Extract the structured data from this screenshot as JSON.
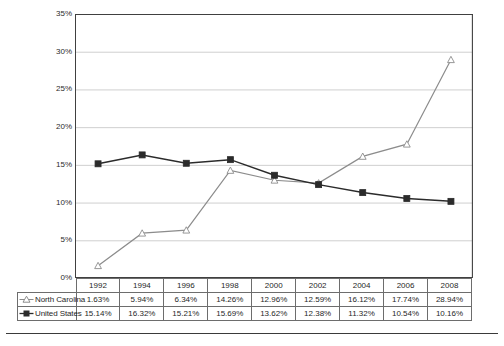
{
  "chart_data": {
    "type": "line",
    "title": "",
    "xlabel": "",
    "ylabel": "",
    "categories": [
      "1992",
      "1994",
      "1996",
      "1998",
      "2000",
      "2002",
      "2004",
      "2006",
      "2008"
    ],
    "ylim": [
      0,
      35
    ],
    "ytick_labels": [
      "0%",
      "5%",
      "10%",
      "15%",
      "20%",
      "25%",
      "30%",
      "35%"
    ],
    "ytick_values": [
      0,
      5,
      10,
      15,
      20,
      25,
      30,
      35
    ],
    "grid": true,
    "legend_position": "data-table",
    "series": [
      {
        "name": "North Carolina",
        "marker": "open-triangle",
        "color": "#8c8c8c",
        "values": [
          1.63,
          5.94,
          6.34,
          14.26,
          12.96,
          12.59,
          16.12,
          17.74,
          28.94
        ],
        "labels": [
          "1.63%",
          "5.94%",
          "6.34%",
          "14.26%",
          "12.96%",
          "12.59%",
          "16.12%",
          "17.74%",
          "28.94%"
        ]
      },
      {
        "name": "United States",
        "marker": "filled-square",
        "color": "#2b2b2b",
        "values": [
          15.14,
          16.32,
          15.21,
          15.69,
          13.62,
          12.38,
          11.32,
          10.54,
          10.16
        ],
        "labels": [
          "15.14%",
          "16.32%",
          "15.21%",
          "15.69%",
          "13.62%",
          "12.38%",
          "11.32%",
          "10.54%",
          "10.16%"
        ]
      }
    ]
  },
  "table": {
    "corner_label": "",
    "column_headers": [
      "1992",
      "1994",
      "1996",
      "1998",
      "2000",
      "2002",
      "2004",
      "2006",
      "2008"
    ],
    "rows": [
      {
        "label": "North Carolina",
        "marker": "open-triangle",
        "cells": [
          "1.63%",
          "5.94%",
          "6.34%",
          "14.26%",
          "12.96%",
          "12.59%",
          "16.12%",
          "17.74%",
          "28.94%"
        ]
      },
      {
        "label": "United States",
        "marker": "filled-square",
        "cells": [
          "15.14%",
          "16.32%",
          "15.21%",
          "15.69%",
          "13.62%",
          "12.38%",
          "11.32%",
          "10.54%",
          "10.16%"
        ]
      }
    ]
  },
  "colors": {
    "north_carolina": "#8c8c8c",
    "united_states": "#2b2b2b",
    "gridline": "#c9c9c9",
    "axis": "#404040",
    "table_border": "#6d6d6d"
  }
}
